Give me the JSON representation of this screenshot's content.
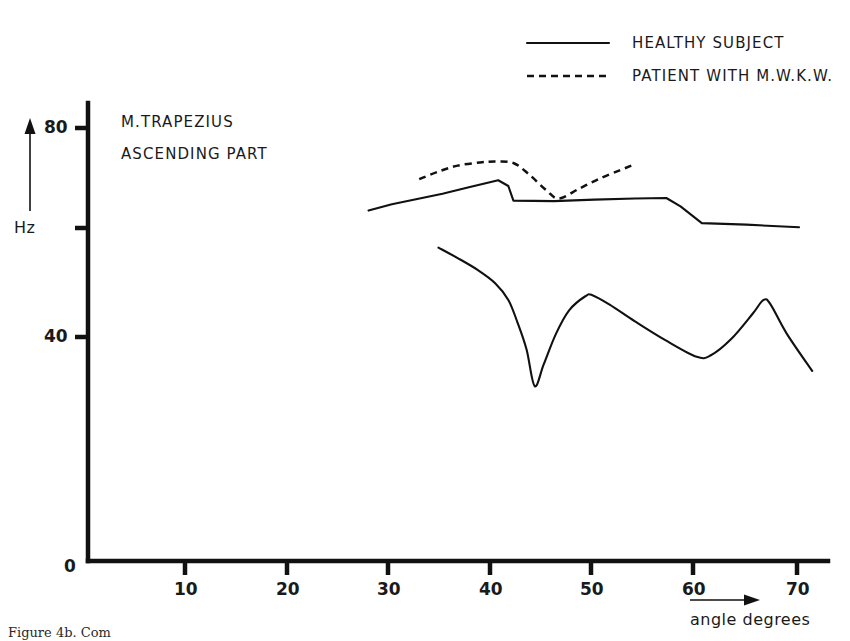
{
  "figure": {
    "caption": "Figure 4b.  Com"
  },
  "chart_data": {
    "type": "line",
    "title": "M.TRAPEZIUS ASCENDING PART",
    "title_lines": [
      "M.TRAPEZIUS",
      "ASCENDING PART"
    ],
    "xlabel": "angle degrees",
    "ylabel": "Hz",
    "xlim": [
      0,
      73
    ],
    "ylim": [
      0,
      86
    ],
    "grid": false,
    "legend_position": "top-right",
    "x_ticks": [
      {
        "value": 0,
        "label": "0"
      },
      {
        "value": 10,
        "label": "10"
      },
      {
        "value": 20,
        "label": "20"
      },
      {
        "value": 30,
        "label": "30"
      },
      {
        "value": 40,
        "label": "40"
      },
      {
        "value": 50,
        "label": "50"
      },
      {
        "value": 60,
        "label": "60"
      },
      {
        "value": 70,
        "label": "70"
      }
    ],
    "y_ticks": [
      {
        "value": 40,
        "label": "40"
      },
      {
        "value": 60,
        "label": ""
      },
      {
        "value": 80,
        "label": "80"
      }
    ],
    "series": [
      {
        "name": "HEALTHY SUBJECT",
        "style": "solid",
        "role": "upper-band",
        "points": [
          [
            27.7,
            64.2
          ],
          [
            30.0,
            65.4
          ],
          [
            32.5,
            66.4
          ],
          [
            35.0,
            67.4
          ],
          [
            37.5,
            68.6
          ],
          [
            40.5,
            70.0
          ],
          [
            41.5,
            68.9
          ],
          [
            42.0,
            66.1
          ],
          [
            46.0,
            66.0
          ],
          [
            50.0,
            66.3
          ],
          [
            54.0,
            66.5
          ],
          [
            57.1,
            66.6
          ],
          [
            58.5,
            65.0
          ],
          [
            60.6,
            61.8
          ],
          [
            65.0,
            61.5
          ],
          [
            70.2,
            61.0
          ]
        ]
      },
      {
        "name": "PATIENT WITH M.W.K.W.",
        "style": "dashed",
        "role": "patient-band",
        "points": [
          [
            32.7,
            70.2
          ],
          [
            34.5,
            71.6
          ],
          [
            36.5,
            72.8
          ],
          [
            38.7,
            73.4
          ],
          [
            40.3,
            73.6
          ],
          [
            42.0,
            73.3
          ],
          [
            43.5,
            71.2
          ],
          [
            45.3,
            68.0
          ],
          [
            46.5,
            66.5
          ],
          [
            48.5,
            68.4
          ],
          [
            50.5,
            70.3
          ],
          [
            52.5,
            71.9
          ],
          [
            53.9,
            73.0
          ]
        ]
      },
      {
        "name": "HEALTHY SUBJECT",
        "style": "solid",
        "role": "lower-band",
        "points": [
          [
            34.6,
            57.1
          ],
          [
            36.5,
            55.1
          ],
          [
            38.5,
            52.8
          ],
          [
            40.2,
            50.3
          ],
          [
            41.5,
            47.1
          ],
          [
            42.4,
            42.8
          ],
          [
            43.3,
            37.6
          ],
          [
            44.1,
            30.6
          ],
          [
            45.0,
            34.8
          ],
          [
            46.2,
            40.6
          ],
          [
            47.5,
            45.1
          ],
          [
            49.1,
            47.8
          ],
          [
            49.8,
            48.0
          ],
          [
            51.5,
            46.2
          ],
          [
            54.0,
            43.0
          ],
          [
            57.0,
            39.4
          ],
          [
            60.1,
            36.2
          ],
          [
            61.5,
            36.5
          ],
          [
            63.5,
            39.6
          ],
          [
            65.6,
            44.4
          ],
          [
            66.7,
            47.1
          ],
          [
            67.4,
            46.2
          ],
          [
            69.0,
            40.6
          ],
          [
            71.5,
            33.5
          ]
        ]
      }
    ],
    "legend": [
      {
        "label": "HEALTHY SUBJECT",
        "style": "solid"
      },
      {
        "label": "PATIENT WITH M.W.K.W.",
        "style": "dashed"
      }
    ]
  }
}
